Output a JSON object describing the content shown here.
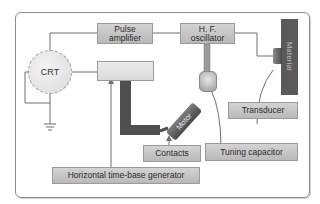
{
  "diagram": {
    "blocks": {
      "pulse_amplifier": "Pulse amplifier",
      "hf_oscillator": "H. F. oscillator",
      "crt": "CRT",
      "material": "Material",
      "motor": "Motor"
    },
    "callouts": {
      "transducer": "Transducer",
      "contacts": "Contacts",
      "tuning_capacitor": "Tuning capacitor",
      "horizontal_time_base_generator": "Horizontal time-base generator"
    },
    "colors": {
      "box_fill": "#c6c6c6",
      "dark_part": "#4f4f4f",
      "wire": "#6f6f6f",
      "frame_border": "#8c8c8c"
    }
  }
}
